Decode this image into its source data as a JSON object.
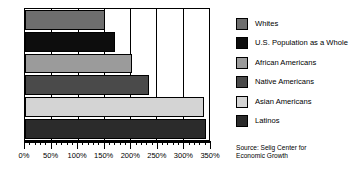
{
  "chart_data": {
    "type": "bar",
    "orientation": "horizontal",
    "title": "",
    "xlabel": "",
    "ylabel": "",
    "xlim": [
      0,
      350
    ],
    "xticks": [
      0,
      50,
      100,
      150,
      200,
      250,
      300,
      350
    ],
    "xticklabels": [
      "0%",
      "50%",
      "100%",
      "150%",
      "200%",
      "250%",
      "300%",
      "350%"
    ],
    "minor_tick_step": 10,
    "grid": true,
    "grid_axis": "x",
    "legend_position": "right",
    "categories": [
      "Whites",
      "U.S. Population as a Whole",
      "African Americans",
      "Native Americans",
      "Asian Americans",
      "Latinos"
    ],
    "values": [
      153,
      171,
      203,
      235,
      340,
      345
    ],
    "colors": [
      "#6e6e6e",
      "#0d0d0d",
      "#9b9b9b",
      "#4a4a4a",
      "#d4d4d4",
      "#2b2b2b"
    ],
    "series": [
      {
        "name": "Percent growth in buying power",
        "values": [
          153,
          171,
          203,
          235,
          340,
          345
        ]
      }
    ],
    "annotations": [
      "Source: Selig Center for Economic Growth"
    ]
  },
  "legend": {
    "items": [
      {
        "label": "Whites",
        "color": "#6e6e6e"
      },
      {
        "label": "U.S. Population as a Whole",
        "color": "#0d0d0d"
      },
      {
        "label": "African Americans",
        "color": "#9b9b9b"
      },
      {
        "label": "Native Americans",
        "color": "#4a4a4a"
      },
      {
        "label": "Asian Americans",
        "color": "#d4d4d4"
      },
      {
        "label": "Latinos",
        "color": "#2b2b2b"
      }
    ]
  },
  "source": {
    "line1": "Source: Selig Center for",
    "line2": "Economic Growth"
  }
}
